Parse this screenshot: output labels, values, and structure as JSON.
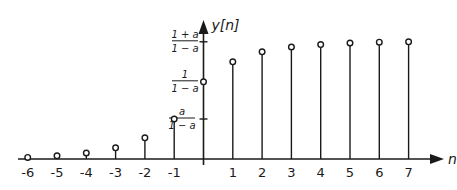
{
  "chart_data": {
    "type": "stem",
    "title": "",
    "xlabel": "n",
    "ylabel": "y[n]",
    "x": [
      -6,
      -5,
      -4,
      -3,
      -2,
      -1,
      0,
      1,
      2,
      3,
      4,
      5,
      6,
      7
    ],
    "values_relative": [
      0.04,
      0.08,
      0.15,
      0.28,
      0.53,
      1.0,
      1.93,
      2.43,
      2.68,
      2.8,
      2.86,
      2.9,
      2.92,
      2.93
    ],
    "x_tick_labels": [
      "-6",
      "-5",
      "-4",
      "-3",
      "-2",
      "-1",
      "1",
      "2",
      "3",
      "4",
      "5",
      "6",
      "7"
    ],
    "y_tick_labels": [
      {
        "num": "a",
        "den": "1 − a",
        "value": 1.0
      },
      {
        "num": "1",
        "den": "1 − a",
        "value": 1.93
      },
      {
        "num": "1 + a",
        "den": "1 − a",
        "value": 2.93
      }
    ],
    "grid": false,
    "marker": "open-circle"
  },
  "axis": {
    "x_label": "n",
    "y_label": "y[n]"
  }
}
